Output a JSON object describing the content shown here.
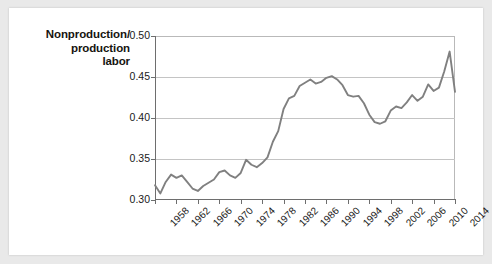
{
  "figure": {
    "axis_title_lines": [
      "Nonproduction/",
      "production",
      "labor"
    ],
    "background_color": "#ffffff",
    "frame_color": "#e9e9e9",
    "line_color": "#808080",
    "grid_color": "#c4c4c4",
    "axis_color": "#6e6e6e"
  },
  "chart_data": {
    "type": "line",
    "title": "",
    "subtitle": "",
    "xlabel": "",
    "ylabel": "Nonproduction/ production labor",
    "xlim": [
      1958,
      2014
    ],
    "ylim": [
      0.3,
      0.5
    ],
    "yticks": [
      0.3,
      0.35,
      0.4,
      0.45,
      0.5
    ],
    "ytick_labels": [
      "0.30",
      "0.35",
      "0.40",
      "0.45",
      "0.50"
    ],
    "xticks": [
      1958,
      1962,
      1966,
      1970,
      1974,
      1978,
      1982,
      1986,
      1990,
      1994,
      1998,
      2002,
      2006,
      2010,
      2014
    ],
    "xtick_labels": [
      "1958",
      "1962",
      "1966",
      "1970",
      "1974",
      "1978",
      "1982",
      "1986",
      "1990",
      "1994",
      "1998",
      "2002",
      "2006",
      "2010",
      "2014"
    ],
    "grid": "horizontal",
    "legend": "none",
    "series": [
      {
        "name": "Nonproduction/production labor",
        "color": "#808080",
        "x": [
          1958,
          1959,
          1960,
          1961,
          1962,
          1963,
          1964,
          1965,
          1966,
          1967,
          1968,
          1969,
          1970,
          1971,
          1972,
          1973,
          1974,
          1975,
          1976,
          1977,
          1978,
          1979,
          1980,
          1981,
          1982,
          1983,
          1984,
          1985,
          1986,
          1987,
          1988,
          1989,
          1990,
          1991,
          1992,
          1993,
          1994,
          1995,
          1996,
          1997,
          1998,
          1999,
          2000,
          2001,
          2002,
          2003,
          2004,
          2005,
          2006,
          2007,
          2008,
          2009,
          2010,
          2011,
          2012,
          2013,
          2014
        ],
        "y": [
          0.318,
          0.308,
          0.322,
          0.331,
          0.327,
          0.33,
          0.322,
          0.314,
          0.311,
          0.317,
          0.321,
          0.325,
          0.334,
          0.336,
          0.33,
          0.327,
          0.333,
          0.349,
          0.343,
          0.34,
          0.345,
          0.352,
          0.371,
          0.384,
          0.411,
          0.424,
          0.427,
          0.439,
          0.443,
          0.447,
          0.442,
          0.444,
          0.449,
          0.451,
          0.447,
          0.44,
          0.428,
          0.426,
          0.427,
          0.418,
          0.404,
          0.395,
          0.393,
          0.396,
          0.409,
          0.414,
          0.412,
          0.419,
          0.428,
          0.421,
          0.426,
          0.441,
          0.433,
          0.437,
          0.457,
          0.481,
          0.432
        ]
      }
    ]
  }
}
